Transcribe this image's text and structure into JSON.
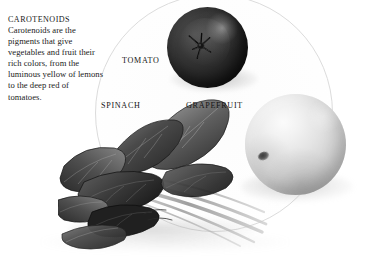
{
  "figure": {
    "background_color": "#ffffff",
    "circle_outline_color": "#dcdcdc"
  },
  "caption": {
    "title": "CAROTENOIDS",
    "body": "Carotenoids are the pigments that give vegetables and fruit their rich colors, from the luminous yellow of lemons to the deep red of tomatoes."
  },
  "items": [
    {
      "id": "tomato",
      "label": "TOMATO",
      "color": "#1f1f1f"
    },
    {
      "id": "spinach",
      "label": "SPINACH",
      "color": "#3b3b3b"
    },
    {
      "id": "grapefruit",
      "label": "GRAPEFRUIT",
      "color": "#d2d2d2"
    }
  ]
}
